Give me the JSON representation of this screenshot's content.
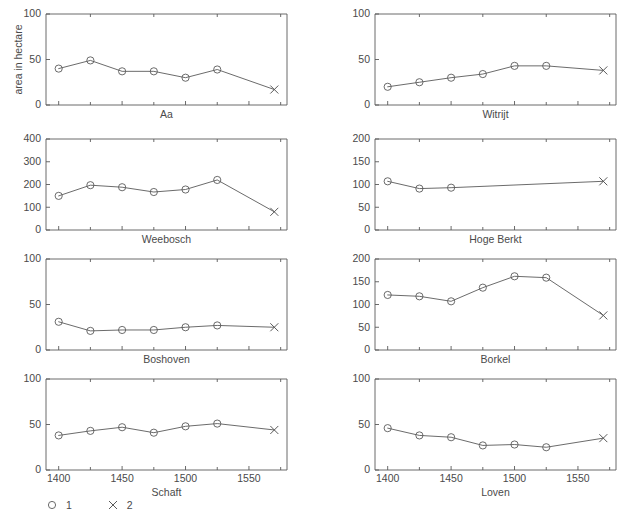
{
  "figure": {
    "width": 633,
    "height": 531,
    "background": "#ffffff",
    "ink_color": "#5a5a5a",
    "ylabel": "area in hectare",
    "footer_caption": ""
  },
  "legend": {
    "position": "bottom-left",
    "entries": [
      {
        "marker": "circle-marker",
        "label": "1"
      },
      {
        "marker": "cross-marker",
        "label": "2"
      }
    ]
  },
  "chart_data": {
    "type": "line",
    "title": "",
    "xlabel": "",
    "ylabel": "area in hectare",
    "grid": false,
    "layout": "2 columns x 4 rows of small-multiple line plots",
    "xlim": [
      1390,
      1580
    ],
    "xticks": [
      1400,
      1450,
      1500,
      1550
    ],
    "xtick_labels": [
      "1400",
      "1450",
      "1500",
      "1550"
    ],
    "xminor_ticks": [
      1425,
      1475,
      1525,
      1575
    ],
    "panels": [
      {
        "name": "Aa",
        "row": 0,
        "col": 0,
        "ylim": [
          0,
          100
        ],
        "yticks": [
          0,
          50,
          100
        ],
        "ytick_labels": [
          "0",
          "50",
          "100"
        ],
        "series": [
          {
            "name": "1",
            "marker": "circle",
            "x": [
              1400,
              1425,
              1450,
              1475,
              1500,
              1525
            ],
            "values": [
              40,
              49,
              37,
              37,
              30,
              39
            ]
          },
          {
            "name": "2",
            "marker": "cross",
            "x": [
              1570
            ],
            "values": [
              17
            ]
          }
        ]
      },
      {
        "name": "Witrijt",
        "row": 0,
        "col": 1,
        "ylim": [
          0,
          100
        ],
        "yticks": [
          0,
          50,
          100
        ],
        "ytick_labels": [
          "0",
          "50",
          "100"
        ],
        "series": [
          {
            "name": "1",
            "marker": "circle",
            "x": [
              1400,
              1425,
              1450,
              1475,
              1500,
              1525
            ],
            "values": [
              20,
              25,
              30,
              34,
              43,
              43
            ]
          },
          {
            "name": "2",
            "marker": "cross",
            "x": [
              1570
            ],
            "values": [
              38
            ]
          }
        ]
      },
      {
        "name": "Weebosch",
        "row": 1,
        "col": 0,
        "ylim": [
          0,
          400
        ],
        "yticks": [
          0,
          100,
          200,
          300,
          400
        ],
        "ytick_labels": [
          "0",
          "100",
          "200",
          "300",
          "400"
        ],
        "series": [
          {
            "name": "1",
            "marker": "circle",
            "x": [
              1400,
              1425,
              1450,
              1475,
              1500,
              1525
            ],
            "values": [
              150,
              197,
              188,
              167,
              178,
              220
            ]
          },
          {
            "name": "2",
            "marker": "cross",
            "x": [
              1570
            ],
            "values": [
              80
            ]
          }
        ]
      },
      {
        "name": "Hoge Berkt",
        "row": 1,
        "col": 1,
        "ylim": [
          0,
          200
        ],
        "yticks": [
          0,
          50,
          100,
          150,
          200
        ],
        "ytick_labels": [
          "0",
          "50",
          "100",
          "150",
          "200"
        ],
        "series": [
          {
            "name": "1",
            "marker": "circle",
            "x": [
              1400,
              1425,
              1450
            ],
            "values": [
              107,
              91,
              93
            ]
          },
          {
            "name": "2",
            "marker": "cross",
            "x": [
              1570
            ],
            "values": [
              107
            ]
          }
        ]
      },
      {
        "name": "Boshoven",
        "row": 2,
        "col": 0,
        "ylim": [
          0,
          100
        ],
        "yticks": [
          0,
          50,
          100
        ],
        "ytick_labels": [
          "0",
          "50",
          "100"
        ],
        "series": [
          {
            "name": "1",
            "marker": "circle",
            "x": [
              1400,
              1425,
              1450,
              1475,
              1500,
              1525
            ],
            "values": [
              31,
              21,
              22,
              22,
              25,
              27
            ]
          },
          {
            "name": "2",
            "marker": "cross",
            "x": [
              1570
            ],
            "values": [
              25
            ]
          }
        ]
      },
      {
        "name": "Borkel",
        "row": 2,
        "col": 1,
        "ylim": [
          0,
          200
        ],
        "yticks": [
          0,
          50,
          100,
          150,
          200
        ],
        "ytick_labels": [
          "0",
          "50",
          "100",
          "150",
          "200"
        ],
        "series": [
          {
            "name": "1",
            "marker": "circle",
            "x": [
              1400,
              1425,
              1450,
              1475,
              1500,
              1525
            ],
            "values": [
              121,
              118,
              107,
              137,
              162,
              159
            ]
          },
          {
            "name": "2",
            "marker": "cross",
            "x": [
              1570
            ],
            "values": [
              76
            ]
          }
        ]
      },
      {
        "name": "Schaft",
        "row": 3,
        "col": 0,
        "ylim": [
          0,
          100
        ],
        "yticks": [
          0,
          50,
          100
        ],
        "ytick_labels": [
          "0",
          "50",
          "100"
        ],
        "show_xticklabels": true,
        "series": [
          {
            "name": "1",
            "marker": "circle",
            "x": [
              1400,
              1425,
              1450,
              1475,
              1500,
              1525
            ],
            "values": [
              38,
              43,
              47,
              41,
              48,
              51
            ]
          },
          {
            "name": "2",
            "marker": "cross",
            "x": [
              1570
            ],
            "values": [
              44
            ]
          }
        ]
      },
      {
        "name": "Loven",
        "row": 3,
        "col": 1,
        "ylim": [
          0,
          100
        ],
        "yticks": [
          0,
          50,
          100
        ],
        "ytick_labels": [
          "0",
          "50",
          "100"
        ],
        "show_xticklabels": true,
        "series": [
          {
            "name": "1",
            "marker": "circle",
            "x": [
              1400,
              1425,
              1450,
              1475,
              1500,
              1525
            ],
            "values": [
              46,
              38,
              36,
              27,
              28,
              25
            ]
          },
          {
            "name": "2",
            "marker": "cross",
            "x": [
              1570
            ],
            "values": [
              35
            ]
          }
        ]
      }
    ]
  }
}
